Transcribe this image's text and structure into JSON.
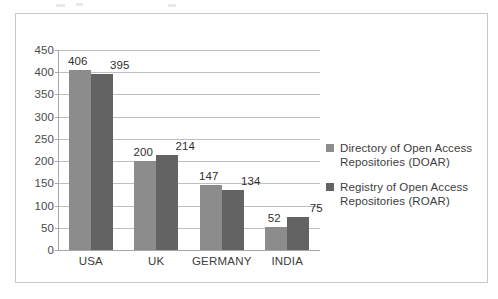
{
  "chart_data": {
    "type": "bar",
    "title": "",
    "subtitle": "",
    "xlabel": "",
    "ylabel": "",
    "categories": [
      "USA",
      "UK",
      "GERMANY",
      "INDIA"
    ],
    "series": [
      {
        "name": "Directory of Open Access Repositories (DOAR)",
        "color": "#8c8c8c",
        "values": [
          406,
          200,
          147,
          52
        ]
      },
      {
        "name": "Registry of Open Access Repositories (ROAR)",
        "color": "#636363",
        "values": [
          395,
          214,
          134,
          75
        ]
      }
    ],
    "ylim": [
      0,
      450
    ],
    "ytick_step": 50,
    "yticks": [
      450,
      400,
      350,
      300,
      250,
      200,
      150,
      100,
      50,
      0
    ],
    "ytick_labels": [
      "450",
      "400",
      "350",
      "300",
      "250",
      "200",
      "150",
      "100",
      "50",
      "0"
    ],
    "data_labels": [
      [
        "406",
        "200",
        "147",
        "52"
      ],
      [
        "395",
        "214",
        "134",
        "75"
      ]
    ],
    "grid": true,
    "grid_axis": "y",
    "legend_position": "right",
    "legend": [
      "Directory of Open Access Repositories (DOAR)",
      "Registry of Open Access Repositories (ROAR)"
    ]
  },
  "figure": {
    "border_color": "#c9c9c9",
    "background": "#ffffff"
  }
}
